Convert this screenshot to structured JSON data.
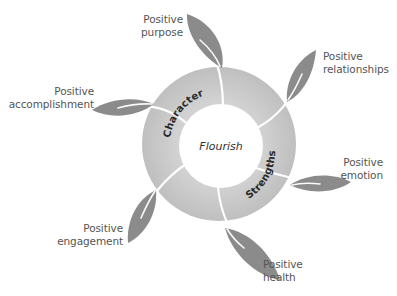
{
  "diagram": {
    "center_label": "Flourish",
    "ring_labels": {
      "upper_left": "Character",
      "lower_right": "Strengths"
    },
    "outcomes": [
      {
        "id": "purpose",
        "line1": "Positive",
        "line2": "purpose"
      },
      {
        "id": "relationships",
        "line1": "Positive",
        "line2": "relationships"
      },
      {
        "id": "accomplishment",
        "line1": "Positive",
        "line2": "accomplishment"
      },
      {
        "id": "emotion",
        "line1": "Positive",
        "line2": "emotion"
      },
      {
        "id": "engagement",
        "line1": "Positive",
        "line2": "engagement"
      },
      {
        "id": "health",
        "line1": "Positive",
        "line2": "health"
      }
    ],
    "colors": {
      "ring": "#c9c9c9",
      "ring_dark": "#bdbdbd",
      "leaf": "#8b8b8b",
      "stem": "#ffffff",
      "text": "#555555",
      "ring_text": "#2a2a2a"
    }
  }
}
